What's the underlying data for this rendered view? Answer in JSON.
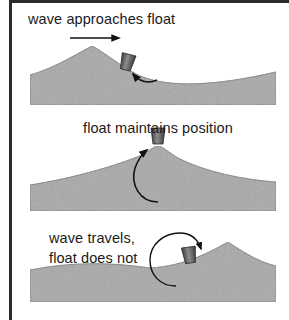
{
  "diagram": {
    "panels": [
      {
        "label": "wave approaches float",
        "annotations": [
          "direction-arrow-right",
          "counterclockwise-curved-arrow"
        ]
      },
      {
        "label": "float maintains position",
        "annotations": [
          "upward-curved-arrow"
        ]
      },
      {
        "label_line1": "wave travels,",
        "label_line2": "float does not",
        "annotations": [
          "circular-clockwise-arrow"
        ]
      }
    ],
    "colors": {
      "frame": "#2a2a2a",
      "water_fill": "#9a9a9a",
      "water_edge": "#6e6e6e",
      "float": "#5a5a5a",
      "text": "#1a1a1a",
      "background": "#ffffff"
    }
  }
}
